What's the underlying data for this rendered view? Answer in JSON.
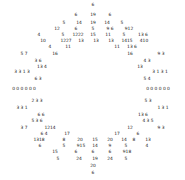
{
  "chart_data": {
    "type": "scatter",
    "title": "",
    "subtitle": "",
    "xlabel": "",
    "ylabel": "",
    "grid": false,
    "legend": null,
    "axes_visible": false,
    "background_color": "#ffffff",
    "label_color": "#1a1a1a",
    "xlim": [
      0,
      185
    ],
    "ylim": [
      0,
      180
    ],
    "value_range": [
      0,
      24
    ],
    "points": [
      {
        "x": 93,
        "y": 5,
        "v": "6"
      },
      {
        "x": 76,
        "y": 15,
        "v": "6"
      },
      {
        "x": 93,
        "y": 15,
        "v": "19"
      },
      {
        "x": 110,
        "y": 15,
        "v": "6"
      },
      {
        "x": 64,
        "y": 23,
        "v": "5"
      },
      {
        "x": 79,
        "y": 23,
        "v": "14"
      },
      {
        "x": 93,
        "y": 23,
        "v": "19"
      },
      {
        "x": 107,
        "y": 23,
        "v": "14"
      },
      {
        "x": 122,
        "y": 23,
        "v": "5"
      },
      {
        "x": 57,
        "y": 29,
        "v": "12"
      },
      {
        "x": 76,
        "y": 29,
        "v": "6"
      },
      {
        "x": 93,
        "y": 29,
        "v": "5"
      },
      {
        "x": 110,
        "y": 29,
        "v": "9 6"
      },
      {
        "x": 129,
        "y": 29,
        "v": "912"
      },
      {
        "x": 39,
        "y": 35,
        "v": "4"
      },
      {
        "x": 63,
        "y": 35,
        "v": "5"
      },
      {
        "x": 78,
        "y": 35,
        "v": "1222"
      },
      {
        "x": 93,
        "y": 35,
        "v": "15"
      },
      {
        "x": 108,
        "y": 35,
        "v": "11"
      },
      {
        "x": 124,
        "y": 35,
        "v": "5"
      },
      {
        "x": 143,
        "y": 35,
        "v": "13 6"
      },
      {
        "x": 43,
        "y": 41,
        "v": "10"
      },
      {
        "x": 66,
        "y": 41,
        "v": "1227"
      },
      {
        "x": 81,
        "y": 41,
        "v": "13"
      },
      {
        "x": 96,
        "y": 41,
        "v": "13"
      },
      {
        "x": 111,
        "y": 41,
        "v": "13"
      },
      {
        "x": 127,
        "y": 41,
        "v": "1415"
      },
      {
        "x": 144,
        "y": 41,
        "v": "410"
      },
      {
        "x": 50,
        "y": 47,
        "v": "4"
      },
      {
        "x": 68,
        "y": 47,
        "v": "11"
      },
      {
        "x": 117,
        "y": 47,
        "v": "11"
      },
      {
        "x": 132,
        "y": 47,
        "v": "13 6"
      },
      {
        "x": 24,
        "y": 54,
        "v": "5 7"
      },
      {
        "x": 55,
        "y": 54,
        "v": "16"
      },
      {
        "x": 130,
        "y": 54,
        "v": "16"
      },
      {
        "x": 161,
        "y": 54,
        "v": "9 3"
      },
      {
        "x": 38,
        "y": 61,
        "v": "3 6"
      },
      {
        "x": 147,
        "y": 61,
        "v": "4 3"
      },
      {
        "x": 42,
        "y": 67,
        "v": "13 4"
      },
      {
        "x": 140,
        "y": 67,
        "v": "13"
      },
      {
        "x": 22,
        "y": 72,
        "v": "3 3 1 3"
      },
      {
        "x": 160,
        "y": 72,
        "v": "3 1 3 1"
      },
      {
        "x": 38,
        "y": 79,
        "v": "6 3"
      },
      {
        "x": 147,
        "y": 79,
        "v": "5 4"
      },
      {
        "x": 24,
        "y": 89,
        "v": "0 0 0 0 0 0"
      },
      {
        "x": 158,
        "y": 89,
        "v": "0 0 0 0 0 0"
      },
      {
        "x": 37,
        "y": 101,
        "v": "2 3 3"
      },
      {
        "x": 148,
        "y": 101,
        "v": "5 3"
      },
      {
        "x": 22,
        "y": 108,
        "v": "3 3 1"
      },
      {
        "x": 163,
        "y": 108,
        "v": "1 3 1"
      },
      {
        "x": 41,
        "y": 115,
        "v": "6 6"
      },
      {
        "x": 143,
        "y": 115,
        "v": "13 6"
      },
      {
        "x": 37,
        "y": 121,
        "v": "5 3 6"
      },
      {
        "x": 148,
        "y": 121,
        "v": "4 3 5"
      },
      {
        "x": 24,
        "y": 128,
        "v": "3 7"
      },
      {
        "x": 50,
        "y": 128,
        "v": "1214"
      },
      {
        "x": 161,
        "y": 128,
        "v": "9 3"
      },
      {
        "x": 130,
        "y": 128,
        "v": "12"
      },
      {
        "x": 44,
        "y": 134,
        "v": "6 4"
      },
      {
        "x": 67,
        "y": 134,
        "v": "17"
      },
      {
        "x": 117,
        "y": 134,
        "v": "17"
      },
      {
        "x": 138,
        "y": 134,
        "v": "6"
      },
      {
        "x": 39,
        "y": 140,
        "v": "1318"
      },
      {
        "x": 64,
        "y": 140,
        "v": "8"
      },
      {
        "x": 80,
        "y": 140,
        "v": "20"
      },
      {
        "x": 95,
        "y": 140,
        "v": "15"
      },
      {
        "x": 110,
        "y": 140,
        "v": "20"
      },
      {
        "x": 124,
        "y": 140,
        "v": "14"
      },
      {
        "x": 134,
        "y": 140,
        "v": "8"
      },
      {
        "x": 148,
        "y": 140,
        "v": "13"
      },
      {
        "x": 40,
        "y": 146,
        "v": "6"
      },
      {
        "x": 64,
        "y": 146,
        "v": "5"
      },
      {
        "x": 81,
        "y": 146,
        "v": "915"
      },
      {
        "x": 95,
        "y": 146,
        "v": "14"
      },
      {
        "x": 110,
        "y": 146,
        "v": "9"
      },
      {
        "x": 126,
        "y": 146,
        "v": "5"
      },
      {
        "x": 147,
        "y": 146,
        "v": "4"
      },
      {
        "x": 55,
        "y": 152,
        "v": "15"
      },
      {
        "x": 76,
        "y": 152,
        "v": "6"
      },
      {
        "x": 93,
        "y": 152,
        "v": "6"
      },
      {
        "x": 110,
        "y": 152,
        "v": "6"
      },
      {
        "x": 127,
        "y": 152,
        "v": "918"
      },
      {
        "x": 58,
        "y": 159,
        "v": "5"
      },
      {
        "x": 79,
        "y": 159,
        "v": "24"
      },
      {
        "x": 95,
        "y": 159,
        "v": "19"
      },
      {
        "x": 110,
        "y": 159,
        "v": "24"
      },
      {
        "x": 126,
        "y": 159,
        "v": "5"
      },
      {
        "x": 93,
        "y": 166,
        "v": "20"
      },
      {
        "x": 93,
        "y": 173,
        "v": "6"
      }
    ]
  }
}
